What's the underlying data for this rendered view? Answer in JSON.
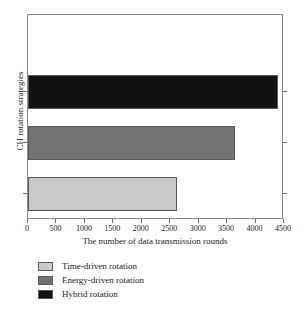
{
  "chart_data": {
    "type": "bar",
    "orientation": "horizontal",
    "title": "",
    "xlabel": "The number of data transmission rounds",
    "ylabel": "CH rotation strategies",
    "categories": [
      "Time-driven rotation",
      "Energy-driven rotation",
      "Hybrid rotation"
    ],
    "values": [
      2620,
      3640,
      4400
    ],
    "xlim": [
      0,
      4500
    ],
    "xticks": [
      0,
      500,
      1000,
      1500,
      2000,
      2500,
      3000,
      3500,
      4000,
      4500
    ],
    "xtick_labels": [
      "0",
      "500",
      "1000",
      "1500",
      "2000",
      "2500",
      "3000",
      "3500",
      "4000",
      "4500"
    ],
    "ytick_labels": [],
    "grid": false,
    "legend_position": "below",
    "series": [
      {
        "name": "Time-driven rotation",
        "value": 2620,
        "color": "#c9c9c9"
      },
      {
        "name": "Energy-driven rotation",
        "value": 3640,
        "color": "#737373"
      },
      {
        "name": "Hybrid rotation",
        "value": 4400,
        "color": "#111111"
      }
    ]
  },
  "axes": {
    "xlabel": "The number of data transmission rounds",
    "ylabel": "CH rotation strategies"
  },
  "legend": {
    "items": [
      {
        "label": "Time-driven rotation",
        "color": "#c9c9c9"
      },
      {
        "label": "Energy-driven rotation",
        "color": "#737373"
      },
      {
        "label": "Hybrid rotation",
        "color": "#111111"
      }
    ]
  },
  "colors": {
    "frame": "#8a8a8a",
    "bar_edge": "#5a5a5a",
    "background": "#ffffff",
    "text": "#1a1a1a"
  }
}
